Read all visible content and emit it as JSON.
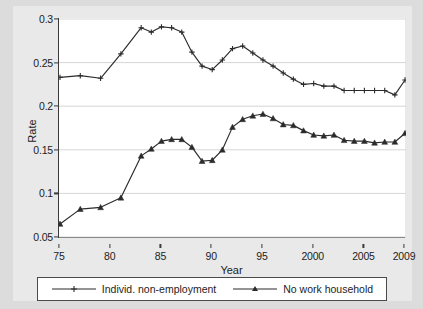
{
  "chart_data": {
    "type": "line",
    "title": "",
    "xlabel": "Year",
    "ylabel": "Rate",
    "grid": true,
    "grid_axis": "y",
    "legend_position": "bottom",
    "xlim": [
      1975,
      2009
    ],
    "ylim": [
      0.05,
      0.3
    ],
    "ytick_values": [
      0.05,
      0.1,
      0.15,
      0.2,
      0.25,
      0.3
    ],
    "ytick_labels": [
      "0.05",
      "0.1",
      "0.15",
      "0.2",
      "0.25",
      "0.3"
    ],
    "xtick_values": [
      1975,
      1980,
      1985,
      1990,
      1995,
      2000,
      2005,
      2009
    ],
    "xtick_labels": [
      "75",
      "80",
      "85",
      "90",
      "95",
      "2000",
      "2005",
      "2009"
    ],
    "series": [
      {
        "name": "Individ. non-employment",
        "marker": "plus",
        "color": "#2b2b2b",
        "x": [
          1975,
          1977,
          1979,
          1981,
          1983,
          1984,
          1985,
          1986,
          1987,
          1988,
          1989,
          1990,
          1991,
          1992,
          1993,
          1994,
          1995,
          1996,
          1997,
          1998,
          1999,
          2000,
          2001,
          2002,
          2003,
          2004,
          2005,
          2006,
          2007,
          2008,
          2009
        ],
        "values": [
          0.233,
          0.235,
          0.232,
          0.26,
          0.29,
          0.285,
          0.291,
          0.29,
          0.285,
          0.262,
          0.246,
          0.242,
          0.253,
          0.266,
          0.269,
          0.261,
          0.253,
          0.246,
          0.238,
          0.231,
          0.225,
          0.226,
          0.223,
          0.223,
          0.218,
          0.218,
          0.218,
          0.218,
          0.218,
          0.213,
          0.23
        ]
      },
      {
        "name": "No work household",
        "marker": "triangle",
        "color": "#2b2b2b",
        "x": [
          1975,
          1977,
          1979,
          1981,
          1983,
          1984,
          1985,
          1986,
          1987,
          1988,
          1989,
          1990,
          1991,
          1992,
          1993,
          1994,
          1995,
          1996,
          1997,
          1998,
          1999,
          2000,
          2001,
          2002,
          2003,
          2004,
          2005,
          2006,
          2007,
          2008,
          2009
        ],
        "values": [
          0.065,
          0.082,
          0.084,
          0.095,
          0.143,
          0.151,
          0.16,
          0.162,
          0.162,
          0.153,
          0.137,
          0.138,
          0.15,
          0.176,
          0.185,
          0.189,
          0.191,
          0.186,
          0.179,
          0.178,
          0.172,
          0.167,
          0.166,
          0.167,
          0.161,
          0.16,
          0.16,
          0.158,
          0.159,
          0.159,
          0.169
        ]
      }
    ]
  },
  "legend": {
    "entries": [
      {
        "label": "Individ. non-employment",
        "marker": "plus-marker"
      },
      {
        "label": "No work household",
        "marker": "triangle-marker"
      }
    ]
  },
  "colors": {
    "figure_background": "#e9e9e9",
    "plot_background": "#ffffff",
    "outer_background": "#dcdcdc",
    "axis": "#3a3a3a",
    "gridline": "#d6d6d6",
    "series": "#2b2b2b",
    "text": "#1d1d1d"
  }
}
